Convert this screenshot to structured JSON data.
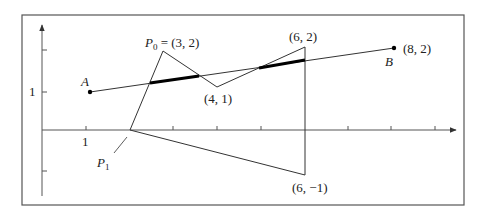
{
  "figure": {
    "frame": {
      "x": 22,
      "y": 15,
      "w": 442,
      "h": 190,
      "stroke": "#555555"
    },
    "axes": {
      "origin_px": [
        42,
        130
      ],
      "x_axis": {
        "from": 42,
        "to": 456,
        "y": 130
      },
      "y_axis": {
        "x": 42,
        "from": 196,
        "to": 25
      },
      "x_ticks_px": [
        86,
        130,
        173,
        217,
        261,
        305,
        348,
        391,
        435
      ],
      "y_ticks_px": [
        92,
        50,
        171
      ],
      "x_tick_label": "1",
      "y_tick_label": "1"
    },
    "segment_AB": {
      "A": {
        "px": [
          90,
          92
        ],
        "label": "A"
      },
      "B": {
        "px": [
          394,
          48
        ],
        "label": "B",
        "coord_label": "(8, 2)"
      }
    },
    "polygon": {
      "vertices_px": [
        [
          130,
          130
        ],
        [
          163,
          51
        ],
        [
          217,
          87
        ],
        [
          305,
          47
        ],
        [
          305,
          175
        ]
      ],
      "labels": {
        "P0": "P",
        "P0_sub": "0",
        "P0_coord": " = (3, 2)",
        "v41": "(4, 1)",
        "v62": "(6, 2)",
        "v6m1": "(6, −1)",
        "P1": "P",
        "P1_sub": "1"
      }
    },
    "highlighted_segments_px": [
      [
        [
          150,
          83
        ],
        [
          199,
          76
        ]
      ],
      [
        [
          259,
          68
        ],
        [
          305,
          60
        ]
      ]
    ],
    "colors": {
      "line": "#333333",
      "thick": "#000000",
      "axis": "#555555"
    }
  }
}
